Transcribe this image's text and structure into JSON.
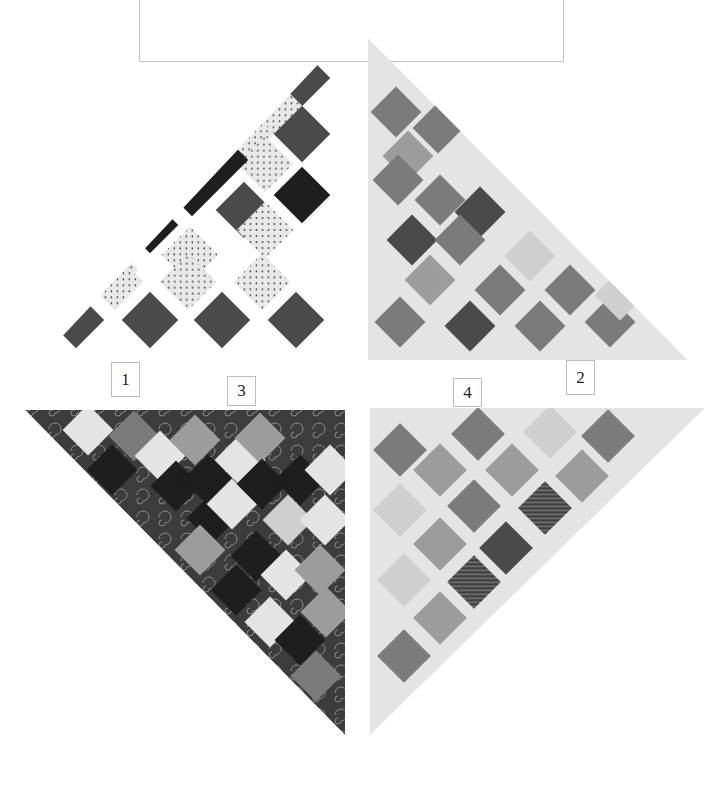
{
  "figure": {
    "frame_box": {
      "left": 139,
      "top": 0,
      "width": 425,
      "height": 62
    },
    "labels": [
      {
        "id": "1",
        "text": "1",
        "left": 111,
        "top": 362,
        "width": 29,
        "height": 35
      },
      {
        "id": "2",
        "text": "2",
        "left": 566,
        "top": 360,
        "width": 29,
        "height": 35
      },
      {
        "id": "3",
        "text": "3",
        "left": 227,
        "top": 376,
        "width": 29,
        "height": 30
      },
      {
        "id": "4",
        "text": "4",
        "left": 453,
        "top": 378,
        "width": 29,
        "height": 29
      }
    ],
    "palette": {
      "dark": "#4a4a4a",
      "black": "#1e1e1e",
      "dots": "#e6e6e6",
      "mid": "#7b7b7b",
      "midlight": "#9c9c9c",
      "light": "#cfcfcf",
      "pale": "#e4e4e4",
      "stripe": "#5e5e5e"
    },
    "blocks": [
      {
        "id": "1",
        "name": "block-1-top-left",
        "triangle": [
          [
            343,
            38
          ],
          [
            40,
            360
          ],
          [
            343,
            360
          ]
        ],
        "background": "none",
        "cell": 40,
        "cells": [
          {
            "cx": 302,
            "cy": 78,
            "t": "dark"
          },
          {
            "cx": 274,
            "cy": 106,
            "t": "dots"
          },
          {
            "cx": 302,
            "cy": 134,
            "t": "dark"
          },
          {
            "cx": 246,
            "cy": 134,
            "t": "dots"
          },
          {
            "cx": 265,
            "cy": 164,
            "t": "dots"
          },
          {
            "cx": 220,
            "cy": 160,
            "t": "black"
          },
          {
            "cx": 302,
            "cy": 195,
            "t": "black"
          },
          {
            "cx": 192,
            "cy": 188,
            "t": "black"
          },
          {
            "cx": 244,
            "cy": 210,
            "t": "dark"
          },
          {
            "cx": 150,
            "cy": 225,
            "t": "black"
          },
          {
            "cx": 190,
            "cy": 255,
            "t": "dots"
          },
          {
            "cx": 265,
            "cy": 230,
            "t": "dots"
          },
          {
            "cx": 110,
            "cy": 270,
            "t": "dots"
          },
          {
            "cx": 76,
            "cy": 320,
            "t": "dark"
          },
          {
            "cx": 150,
            "cy": 320,
            "t": "dark"
          },
          {
            "cx": 222,
            "cy": 320,
            "t": "dark"
          },
          {
            "cx": 296,
            "cy": 320,
            "t": "dark"
          },
          {
            "cx": 115,
            "cy": 282,
            "t": "dots"
          },
          {
            "cx": 188,
            "cy": 282,
            "t": "dots"
          },
          {
            "cx": 262,
            "cy": 282,
            "t": "dots"
          }
        ]
      },
      {
        "id": "2",
        "name": "block-2-top-right",
        "triangle": [
          [
            368,
            38
          ],
          [
            368,
            360
          ],
          [
            688,
            360
          ]
        ],
        "background": "pale",
        "cell": 36,
        "cells": [
          {
            "cx": 396,
            "cy": 112,
            "t": "mid"
          },
          {
            "cx": 438,
            "cy": 128,
            "t": "mid"
          },
          {
            "cx": 408,
            "cy": 156,
            "t": "midlight"
          },
          {
            "cx": 398,
            "cy": 180,
            "t": "mid"
          },
          {
            "cx": 440,
            "cy": 200,
            "t": "mid"
          },
          {
            "cx": 480,
            "cy": 212,
            "t": "dark"
          },
          {
            "cx": 412,
            "cy": 240,
            "t": "dark"
          },
          {
            "cx": 460,
            "cy": 240,
            "t": "mid"
          },
          {
            "cx": 530,
            "cy": 256,
            "t": "light"
          },
          {
            "cx": 430,
            "cy": 280,
            "t": "midlight"
          },
          {
            "cx": 500,
            "cy": 290,
            "t": "mid"
          },
          {
            "cx": 570,
            "cy": 290,
            "t": "mid"
          },
          {
            "cx": 400,
            "cy": 322,
            "t": "mid"
          },
          {
            "cx": 470,
            "cy": 326,
            "t": "dark"
          },
          {
            "cx": 540,
            "cy": 326,
            "t": "mid"
          },
          {
            "cx": 610,
            "cy": 322,
            "t": "mid"
          },
          {
            "cx": 620,
            "cy": 295,
            "t": "light"
          }
        ]
      },
      {
        "id": "3",
        "name": "block-3-bottom-left",
        "triangle": [
          [
            25,
            410
          ],
          [
            345,
            410
          ],
          [
            345,
            735
          ]
        ],
        "background": "dark",
        "cell": 36,
        "cells": [
          {
            "cx": 88,
            "cy": 430,
            "t": "pale"
          },
          {
            "cx": 112,
            "cy": 470,
            "t": "black"
          },
          {
            "cx": 134,
            "cy": 436,
            "t": "mid"
          },
          {
            "cx": 160,
            "cy": 456,
            "t": "pale"
          },
          {
            "cx": 176,
            "cy": 486,
            "t": "black"
          },
          {
            "cx": 195,
            "cy": 440,
            "t": "midlight"
          },
          {
            "cx": 208,
            "cy": 480,
            "t": "black"
          },
          {
            "cx": 240,
            "cy": 460,
            "t": "pale"
          },
          {
            "cx": 212,
            "cy": 518,
            "t": "black"
          },
          {
            "cx": 232,
            "cy": 504,
            "t": "pale"
          },
          {
            "cx": 260,
            "cy": 438,
            "t": "midlight"
          },
          {
            "cx": 262,
            "cy": 484,
            "t": "black"
          },
          {
            "cx": 300,
            "cy": 480,
            "t": "black"
          },
          {
            "cx": 288,
            "cy": 520,
            "t": "light"
          },
          {
            "cx": 325,
            "cy": 520,
            "t": "pale"
          },
          {
            "cx": 256,
            "cy": 556,
            "t": "black"
          },
          {
            "cx": 200,
            "cy": 550,
            "t": "midlight"
          },
          {
            "cx": 236,
            "cy": 590,
            "t": "black"
          },
          {
            "cx": 286,
            "cy": 575,
            "t": "pale"
          },
          {
            "cx": 320,
            "cy": 570,
            "t": "midlight"
          },
          {
            "cx": 270,
            "cy": 622,
            "t": "pale"
          },
          {
            "cx": 300,
            "cy": 640,
            "t": "black"
          },
          {
            "cx": 326,
            "cy": 612,
            "t": "midlight"
          },
          {
            "cx": 316,
            "cy": 676,
            "t": "mid"
          },
          {
            "cx": 330,
            "cy": 470,
            "t": "pale"
          }
        ]
      },
      {
        "id": "4",
        "name": "block-4-bottom-right",
        "triangle": [
          [
            370,
            408
          ],
          [
            705,
            408
          ],
          [
            370,
            735
          ]
        ],
        "background": "pale",
        "cell": 38,
        "cells": [
          {
            "cx": 400,
            "cy": 450,
            "t": "mid"
          },
          {
            "cx": 478,
            "cy": 434,
            "t": "mid"
          },
          {
            "cx": 550,
            "cy": 432,
            "t": "light"
          },
          {
            "cx": 608,
            "cy": 436,
            "t": "mid"
          },
          {
            "cx": 440,
            "cy": 470,
            "t": "midlight"
          },
          {
            "cx": 512,
            "cy": 470,
            "t": "midlight"
          },
          {
            "cx": 582,
            "cy": 476,
            "t": "midlight"
          },
          {
            "cx": 400,
            "cy": 510,
            "t": "light"
          },
          {
            "cx": 474,
            "cy": 506,
            "t": "mid"
          },
          {
            "cx": 545,
            "cy": 508,
            "t": "stripe"
          },
          {
            "cx": 440,
            "cy": 544,
            "t": "midlight"
          },
          {
            "cx": 506,
            "cy": 548,
            "t": "dark"
          },
          {
            "cx": 404,
            "cy": 580,
            "t": "light"
          },
          {
            "cx": 474,
            "cy": 582,
            "t": "stripe"
          },
          {
            "cx": 440,
            "cy": 618,
            "t": "midlight"
          },
          {
            "cx": 404,
            "cy": 656,
            "t": "mid"
          }
        ]
      }
    ]
  }
}
